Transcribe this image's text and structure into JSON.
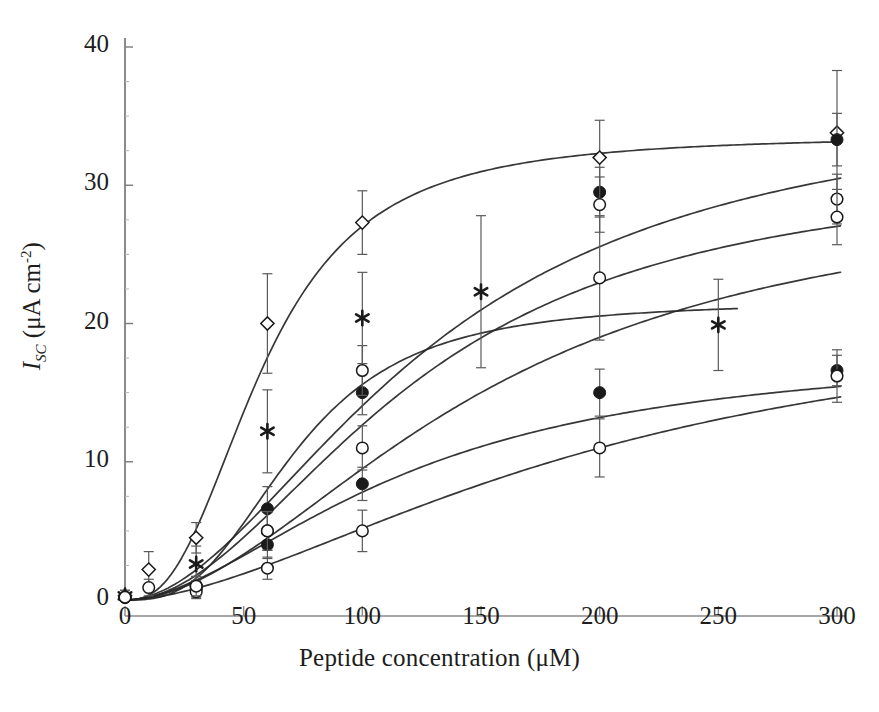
{
  "figure": {
    "title": "",
    "background": "#ffffff",
    "line_color": "#262626",
    "marker_color": "#1a1a1a",
    "errorbar_color": "#5a5a5a"
  },
  "axes": {
    "x": {
      "label_prefix": "Peptide concentration (",
      "label_unit": "μM",
      "label_suffix": ")",
      "label_full": "Peptide concentration (μM)",
      "ticks": [
        0,
        50,
        100,
        150,
        200,
        250,
        300
      ],
      "tick_labels": [
        "0",
        "50",
        "100",
        "150",
        "200",
        "250",
        "300"
      ],
      "min": 0,
      "max": 315,
      "grid": false
    },
    "y": {
      "label_symbol": "I",
      "label_sub": "SC",
      "label_unit_open": " (μA cm",
      "label_exp": "-2",
      "label_close": ")",
      "label_full": "I_SC (μA cm^-2)",
      "ticks": [
        0,
        10,
        20,
        30,
        40
      ],
      "tick_labels": [
        "0",
        "10",
        "20",
        "30",
        "40"
      ],
      "min": 0,
      "max": 40,
      "grid": false
    }
  },
  "chart_data": {
    "type": "scatter",
    "title": "",
    "xlabel": "Peptide concentration (μM)",
    "ylabel": "I_SC (μA cm^-2)",
    "xlim": [
      0,
      315
    ],
    "ylim": [
      0,
      40
    ],
    "grid": false,
    "legend": "none",
    "series": [
      {
        "name": "series-1-open-diamond",
        "marker": "open-diamond",
        "x": [
          0,
          10,
          30,
          60,
          100,
          200,
          300
        ],
        "values": [
          0.3,
          2.2,
          4.5,
          20.0,
          27.3,
          32.0,
          33.8
        ],
        "error": [
          0.4,
          1.3,
          1.1,
          3.6,
          2.3,
          2.7,
          4.5
        ],
        "fit": {
          "model": "sigmoid",
          "top": 33.6,
          "ec50": 58,
          "hill": 2.6
        }
      },
      {
        "name": "series-2-asterisk",
        "marker": "asterisk",
        "x": [
          0,
          30,
          60,
          100,
          150,
          250
        ],
        "values": [
          0.3,
          2.6,
          12.2,
          20.4,
          22.3,
          19.9
        ],
        "error": [
          0.4,
          1.3,
          3.0,
          3.3,
          5.5,
          3.3
        ],
        "fit": {
          "model": "sigmoid",
          "top": 21.6,
          "ec50": 72,
          "hill": 2.9
        }
      },
      {
        "name": "series-3-filled-circle-high",
        "marker": "filled-circle",
        "x": [
          0,
          30,
          60,
          100,
          200,
          300
        ],
        "values": [
          0.2,
          1.0,
          6.6,
          15.0,
          29.5,
          33.3
        ],
        "error": [
          0.3,
          0.7,
          1.6,
          1.6,
          1.8,
          1.9
        ],
        "fit": {
          "model": "sigmoid",
          "top": 36.5,
          "ec50": 128,
          "hill": 1.9
        }
      },
      {
        "name": "series-4-open-circle-high",
        "marker": "open-circle",
        "x": [
          0,
          30,
          60,
          100,
          200,
          300
        ],
        "values": [
          0.2,
          1.0,
          5.0,
          16.6,
          28.6,
          29.0
        ],
        "error": [
          0.3,
          0.7,
          1.4,
          1.8,
          2.0,
          1.8
        ],
        "fit": {
          "model": "sigmoid",
          "top": 31.5,
          "ec50": 122,
          "hill": 2.0
        }
      },
      {
        "name": "series-5-filled-circle-low",
        "marker": "filled-circle",
        "x": [
          0,
          30,
          60,
          100,
          200,
          300
        ],
        "values": [
          0.2,
          0.8,
          4.0,
          8.4,
          15.0,
          16.6
        ],
        "error": [
          0.3,
          0.6,
          1.0,
          1.2,
          1.7,
          1.1
        ],
        "fit": {
          "model": "sigmoid",
          "top": 18.3,
          "ec50": 118,
          "hill": 1.8
        }
      },
      {
        "name": "series-6-open-circle-low",
        "marker": "open-circle",
        "x": [
          0,
          30,
          60,
          100,
          200,
          300
        ],
        "values": [
          0.2,
          0.6,
          2.3,
          5.0,
          11.0,
          16.2
        ],
        "error": [
          0.3,
          0.5,
          0.8,
          1.5,
          2.1,
          1.9
        ],
        "fit": {
          "model": "sigmoid",
          "top": 22.0,
          "ec50": 200,
          "hill": 1.7
        }
      },
      {
        "name": "series-7-open-circle-mid",
        "marker": "open-circle",
        "x": [
          0,
          10,
          30,
          60,
          100,
          200,
          300
        ],
        "values": [
          0.2,
          0.9,
          1.0,
          5.0,
          11.0,
          23.3,
          27.7
        ],
        "error": [
          0.3,
          0.6,
          0.7,
          1.4,
          1.6,
          4.5,
          2.0
        ],
        "fit": {
          "model": "sigmoid",
          "top": 30.0,
          "ec50": 150,
          "hill": 1.9
        }
      }
    ]
  }
}
